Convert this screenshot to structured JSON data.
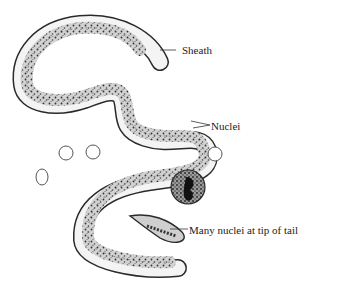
{
  "diagram": {
    "labels": {
      "sheath": "Sheath",
      "nuclei": "Nuclei",
      "tail_nuclei": "Many nuclei at tip of tail"
    },
    "elements": {
      "body": "worm-body",
      "red_cells_count": 4,
      "white_cell_count": 1
    },
    "colors": {
      "outline": "#2a2a2a",
      "sheath_fill": "#f4f4f4",
      "body_fill": "#c9c9c9",
      "nuclei": "#333333",
      "background": "#ffffff"
    }
  }
}
